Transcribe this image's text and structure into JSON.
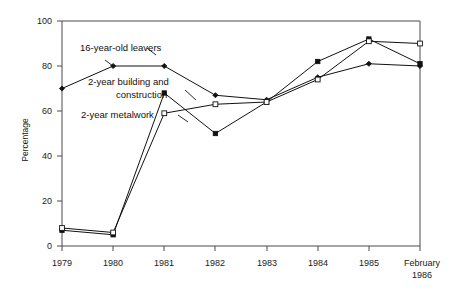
{
  "chart_data": {
    "type": "line",
    "title": "",
    "xlabel": "",
    "ylabel": "Percentage",
    "ylim": [
      0,
      100
    ],
    "yticks": [
      0,
      20,
      40,
      60,
      80,
      100
    ],
    "grid": false,
    "legend_position": "inline-annotations",
    "categories": [
      "1979",
      "1980",
      "1981",
      "1982",
      "1983",
      "1984",
      "1985",
      "February 1986"
    ],
    "series": [
      {
        "name": "16-year-old leavers",
        "marker": "filled-diamond",
        "values": [
          70,
          80,
          80,
          67,
          65,
          75,
          81,
          80
        ]
      },
      {
        "name": "2-year building and construction",
        "marker": "filled-square",
        "values": [
          7,
          5,
          68,
          50,
          64,
          82,
          92,
          81
        ]
      },
      {
        "name": "2-year metalwork",
        "marker": "open-square",
        "values": [
          8,
          6,
          59,
          63,
          64,
          74,
          91,
          90
        ]
      }
    ],
    "annotations": [
      {
        "text": "16-year-old leavers",
        "series": "16-year-old leavers"
      },
      {
        "text": "2-year building and",
        "series": "2-year building and construction"
      },
      {
        "text": "construction",
        "series": "2-year building and construction"
      },
      {
        "text": "2-year metalwork",
        "series": "2-year metalwork"
      }
    ]
  },
  "axes": {
    "y_title": "Percentage",
    "y_tick_labels": [
      "0",
      "20",
      "40",
      "60",
      "80",
      "100"
    ],
    "x_tick_labels": [
      "1979",
      "1980",
      "1981",
      "1982",
      "1983",
      "1984",
      "1985"
    ],
    "x_last_label_line1": "February",
    "x_last_label_line2": "1986"
  },
  "annotations": {
    "label_leavers": "16-year-old leavers",
    "label_building_line1": "2-year building and",
    "label_building_line2": "construction",
    "label_metalwork": "2-year metalwork"
  },
  "colors": {
    "axis": "#4a4a4a",
    "line": "#111111",
    "background": "#ffffff",
    "text": "#1a1a1a"
  }
}
